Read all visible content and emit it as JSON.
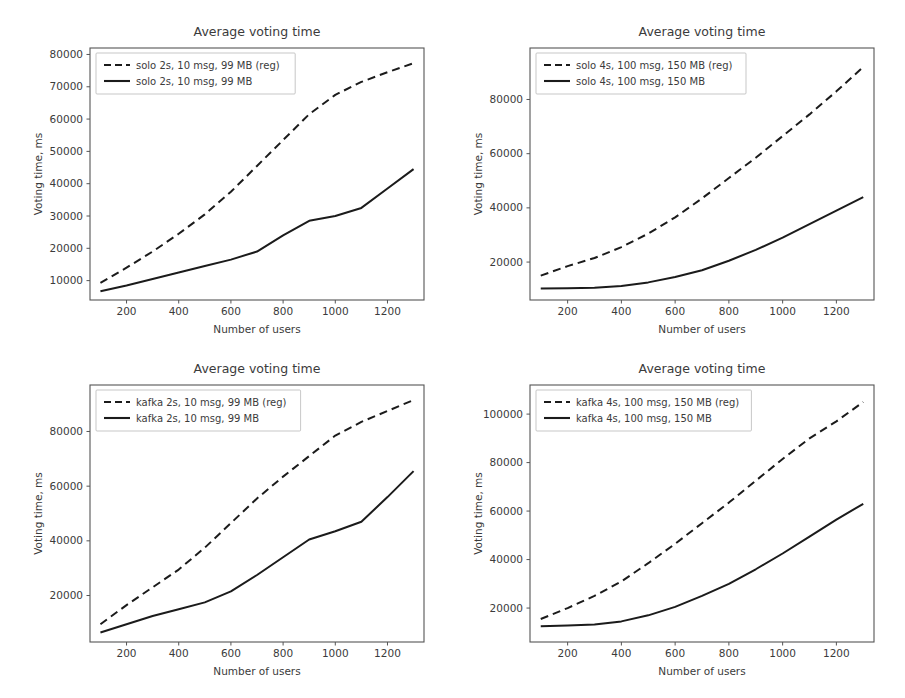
{
  "figure": {
    "title_common": "Average voting time",
    "xlabel_common": "Number of users",
    "ylabel_common": "Voting time, ms",
    "line_color": "#1b1b1b",
    "background": "#ffffff",
    "axis_color": "#555555"
  },
  "chart_data": [
    {
      "id": "solo-2s",
      "type": "line",
      "title": "Average voting time",
      "xlabel": "Number of users",
      "ylabel": "Voting time, ms",
      "grid": false,
      "legend_position": "upper left",
      "xlim": [
        60,
        1340
      ],
      "ylim": [
        4000,
        82000
      ],
      "xticks": [
        200,
        400,
        600,
        800,
        1000,
        1200
      ],
      "xtick_labels": [
        "200",
        "400",
        "600",
        "800",
        "1000",
        "1200"
      ],
      "yticks": [
        10000,
        20000,
        30000,
        40000,
        50000,
        60000,
        70000,
        80000
      ],
      "ytick_labels": [
        "10000",
        "20000",
        "30000",
        "40000",
        "50000",
        "60000",
        "70000",
        "80000"
      ],
      "x": [
        100,
        200,
        300,
        400,
        500,
        600,
        700,
        800,
        900,
        1000,
        1100,
        1200,
        1300
      ],
      "series": [
        {
          "name": "solo 2s, 10 msg, 99 MB (reg)",
          "style": "dashed",
          "values": [
            9300,
            14000,
            19000,
            24500,
            30500,
            37500,
            45500,
            53500,
            61500,
            67500,
            71500,
            74500,
            77300
          ]
        },
        {
          "name": "solo 2s, 10 msg, 99 MB",
          "style": "solid",
          "values": [
            6700,
            8500,
            10500,
            12500,
            14500,
            16500,
            19000,
            24000,
            28500,
            30000,
            32500,
            38500,
            44500
          ]
        }
      ]
    },
    {
      "id": "solo-4s",
      "type": "line",
      "title": "Average voting time",
      "xlabel": "Number of users",
      "ylabel": "Voting time, ms",
      "grid": false,
      "legend_position": "upper left",
      "xlim": [
        60,
        1340
      ],
      "ylim": [
        6000,
        99000
      ],
      "xticks": [
        200,
        400,
        600,
        800,
        1000,
        1200
      ],
      "xtick_labels": [
        "200",
        "400",
        "600",
        "800",
        "1000",
        "1200"
      ],
      "yticks": [
        20000,
        40000,
        60000,
        80000
      ],
      "ytick_labels": [
        "20000",
        "40000",
        "60000",
        "80000"
      ],
      "x": [
        100,
        200,
        300,
        400,
        500,
        600,
        700,
        800,
        900,
        1000,
        1100,
        1200,
        1300
      ],
      "series": [
        {
          "name": "solo 4s, 100 msg, 150 MB (reg)",
          "style": "dashed",
          "values": [
            15000,
            18500,
            21500,
            25500,
            30500,
            36500,
            43500,
            51000,
            58500,
            66500,
            74500,
            83000,
            92000
          ]
        },
        {
          "name": "solo 4s, 100 msg, 150 MB",
          "style": "solid",
          "values": [
            10200,
            10300,
            10500,
            11200,
            12500,
            14500,
            17000,
            20500,
            24500,
            29000,
            34000,
            39000,
            44000
          ]
        }
      ]
    },
    {
      "id": "kafka-2s",
      "type": "line",
      "title": "Average voting time",
      "xlabel": "Number of users",
      "ylabel": "Voting time, ms",
      "grid": false,
      "legend_position": "upper left",
      "xlim": [
        60,
        1340
      ],
      "ylim": [
        3000,
        97000
      ],
      "xticks": [
        200,
        400,
        600,
        800,
        1000,
        1200
      ],
      "xtick_labels": [
        "200",
        "400",
        "600",
        "800",
        "1000",
        "1200"
      ],
      "yticks": [
        20000,
        40000,
        60000,
        80000
      ],
      "ytick_labels": [
        "20000",
        "40000",
        "60000",
        "80000"
      ],
      "x": [
        100,
        200,
        300,
        400,
        500,
        600,
        700,
        800,
        900,
        1000,
        1100,
        1200,
        1300
      ],
      "series": [
        {
          "name": "kafka 2s, 10 msg, 99 MB (reg)",
          "style": "dashed",
          "values": [
            9500,
            16500,
            23000,
            29500,
            37500,
            46500,
            55500,
            63500,
            71000,
            78500,
            83500,
            87500,
            91500
          ]
        },
        {
          "name": "kafka 2s, 10 msg, 99 MB",
          "style": "solid",
          "values": [
            6500,
            9500,
            12500,
            15000,
            17500,
            21500,
            27500,
            34000,
            40500,
            43500,
            47000,
            56000,
            65500
          ]
        }
      ]
    },
    {
      "id": "kafka-4s",
      "type": "line",
      "title": "Average voting time",
      "xlabel": "Number of users",
      "ylabel": "Voting time, ms",
      "grid": false,
      "legend_position": "upper left",
      "xlim": [
        60,
        1340
      ],
      "ylim": [
        6000,
        112000
      ],
      "xticks": [
        200,
        400,
        600,
        800,
        1000,
        1200
      ],
      "xtick_labels": [
        "200",
        "400",
        "600",
        "800",
        "1000",
        "1200"
      ],
      "yticks": [
        20000,
        40000,
        60000,
        80000,
        100000
      ],
      "ytick_labels": [
        "20000",
        "40000",
        "60000",
        "80000",
        "100000"
      ],
      "x": [
        100,
        200,
        300,
        400,
        500,
        600,
        700,
        800,
        900,
        1000,
        1100,
        1200,
        1300
      ],
      "series": [
        {
          "name": "kafka 4s, 100 msg, 150 MB (reg)",
          "style": "dashed",
          "values": [
            15500,
            20000,
            25000,
            31000,
            38500,
            46500,
            55000,
            63500,
            72500,
            81500,
            90000,
            97000,
            105000
          ]
        },
        {
          "name": "kafka 4s, 100 msg, 150 MB",
          "style": "solid",
          "values": [
            12500,
            12800,
            13200,
            14500,
            17000,
            20500,
            25000,
            30000,
            36000,
            42500,
            49500,
            56500,
            63000
          ]
        }
      ]
    }
  ],
  "subplots": [
    {
      "id": "solo-2s",
      "name": "chart-solo-2s",
      "left": 12,
      "top": 18,
      "width": 430,
      "height": 330
    },
    {
      "id": "solo-4s",
      "name": "chart-solo-4s",
      "left": 452,
      "top": 18,
      "width": 440,
      "height": 330
    },
    {
      "id": "kafka-2s",
      "name": "chart-kafka-2s",
      "left": 12,
      "top": 355,
      "width": 430,
      "height": 335
    },
    {
      "id": "kafka-4s",
      "name": "chart-kafka-4s",
      "left": 452,
      "top": 355,
      "width": 440,
      "height": 335
    }
  ]
}
